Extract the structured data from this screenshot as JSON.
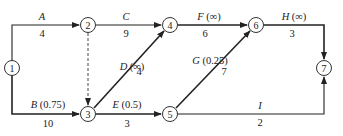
{
  "nodes": [
    {
      "id": "1",
      "x": 12,
      "y": 68
    },
    {
      "id": "2",
      "x": 88,
      "y": 25
    },
    {
      "id": "3",
      "x": 88,
      "y": 114
    },
    {
      "id": "4",
      "x": 170,
      "y": 25
    },
    {
      "id": "5",
      "x": 170,
      "y": 114
    },
    {
      "id": "6",
      "x": 256,
      "y": 25
    },
    {
      "id": "7",
      "x": 328,
      "y": 68
    }
  ],
  "edges": {
    "A": {
      "name": "A",
      "param": "",
      "duration": "4",
      "from": "1",
      "to": "2"
    },
    "B": {
      "name": "B",
      "param": "(0.75)",
      "duration": "10",
      "from": "1",
      "to": "3"
    },
    "C": {
      "name": "C",
      "param": "",
      "duration": "9",
      "from": "2",
      "to": "4"
    },
    "dummy": {
      "from": "2",
      "to": "3",
      "style": "dashed"
    },
    "D": {
      "name": "D",
      "param": "(∞)",
      "duration": "4",
      "from": "3",
      "to": "4"
    },
    "E": {
      "name": "E",
      "param": "(0.5)",
      "duration": "3",
      "from": "3",
      "to": "5"
    },
    "F": {
      "name": "F",
      "param": "(∞)",
      "duration": "6",
      "from": "4",
      "to": "6"
    },
    "G": {
      "name": "G",
      "param": "(0.25)",
      "duration": "7",
      "from": "5",
      "to": "6"
    },
    "H": {
      "name": "H",
      "param": "(∞)",
      "duration": "3",
      "from": "6",
      "to": "7"
    },
    "I": {
      "name": "I",
      "param": "",
      "duration": "2",
      "from": "5",
      "to": "7"
    }
  }
}
